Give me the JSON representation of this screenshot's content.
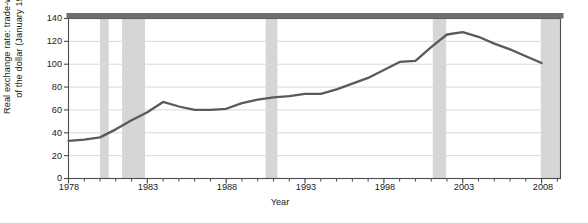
{
  "figure": {
    "width": 588,
    "height": 223,
    "background": "#ffffff",
    "line_color": "#5a5a5a",
    "shade_color": "#d6d6d6",
    "grid_color": "#d9d9d9",
    "axis_color": "#4d4d4d",
    "top_band_color": "#6e6e6e"
  },
  "chart_data": {
    "type": "line",
    "title": "",
    "subtitle": "",
    "xlabel": "Year",
    "ylabel": "Real exchange rate: trade-weighted value of the dollar (January 1997 = 100)",
    "ylabel_lines": [
      "Real exchange rate: trade-weighted value",
      "of the dollar (January 1997 = 100)"
    ],
    "xlim": [
      1978,
      2009.2
    ],
    "ylim": [
      0,
      140
    ],
    "yticks": [
      0,
      20,
      40,
      60,
      80,
      100,
      120,
      140
    ],
    "ytick_labels": [
      "0",
      "20",
      "40",
      "60",
      "80",
      "100",
      "120",
      "140"
    ],
    "xticks": [
      1978,
      1983,
      1988,
      1993,
      1998,
      2003,
      2008
    ],
    "xtick_labels": [
      "1978",
      "1983",
      "1988",
      "1993",
      "1998",
      "2003",
      "2008"
    ],
    "xtick_minor_step": 1,
    "grid": "horizontal",
    "legend": "none",
    "series": [
      {
        "name": "Real trade-weighted value of the dollar",
        "x": [
          1978,
          1979,
          1980,
          1981,
          1982,
          1983,
          1984,
          1985,
          1986,
          1987,
          1988,
          1989,
          1990,
          1991,
          1992,
          1993,
          1994,
          1995,
          1996,
          1997,
          1998,
          1999,
          2000,
          2001,
          2002,
          2003,
          2004,
          2005,
          2006,
          2007,
          2008
        ],
        "values": [
          33,
          34,
          36,
          43,
          51,
          58,
          67,
          63,
          60,
          60,
          61,
          66,
          69,
          71,
          72,
          74,
          74,
          78,
          83,
          88,
          95,
          102,
          103,
          115,
          126,
          128,
          124,
          118,
          113,
          107,
          101
        ]
      }
    ],
    "shaded_regions": [
      {
        "label": "recession",
        "start": 1980.0,
        "end": 1980.55
      },
      {
        "label": "recession",
        "start": 1981.4,
        "end": 1982.85
      },
      {
        "label": "recession",
        "start": 1990.5,
        "end": 1991.25
      },
      {
        "label": "recession",
        "start": 2001.1,
        "end": 2001.95
      },
      {
        "label": "recession",
        "start": 2007.95,
        "end": 2009.2
      }
    ]
  }
}
